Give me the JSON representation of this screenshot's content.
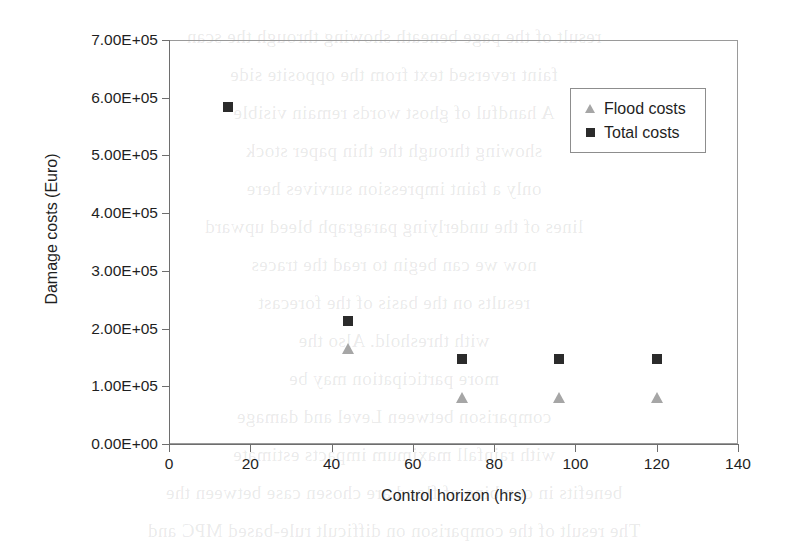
{
  "chart_data": {
    "type": "scatter",
    "title": "",
    "xlabel": "Control horizon (hrs)",
    "ylabel": "Damage costs (Euro)",
    "xlim": [
      0,
      140
    ],
    "ylim": [
      0,
      700000
    ],
    "xticks": [
      "0",
      "20",
      "40",
      "60",
      "80",
      "100",
      "120",
      "140"
    ],
    "xtick_values": [
      0,
      20,
      40,
      60,
      80,
      100,
      120,
      140
    ],
    "yticks": [
      "0.00E+00",
      "1.00E+05",
      "2.00E+05",
      "3.00E+05",
      "4.00E+05",
      "5.00E+05",
      "6.00E+05",
      "7.00E+05"
    ],
    "ytick_values": [
      0,
      100000,
      200000,
      300000,
      400000,
      500000,
      600000,
      700000
    ],
    "grid": false,
    "legend_position": "top-right",
    "x": [
      14.5,
      44,
      72,
      96,
      120
    ],
    "series": [
      {
        "name": "Flood costs",
        "marker": "triangle",
        "color": "#a6a6a6",
        "x": [
          44,
          72,
          96,
          120
        ],
        "values": [
          166000,
          81000,
          81000,
          81000
        ]
      },
      {
        "name": "Total costs",
        "marker": "square",
        "color": "#2b2b2b",
        "x": [
          14.5,
          44,
          72,
          96,
          120
        ],
        "values": [
          584000,
          213000,
          147000,
          147000,
          147000
        ]
      }
    ]
  },
  "legend": {
    "items": [
      {
        "label": "Flood costs",
        "marker": "triangle",
        "color": "#a6a6a6"
      },
      {
        "label": "Total costs",
        "marker": "square",
        "color": "#2b2b2b"
      }
    ]
  },
  "bleed_text": [
    "result of the page beneath showing through the scan",
    "faint reversed text from the opposite side",
    "A handful of ghost words remain visible",
    "showing through the thin paper stock",
    "only a faint impression survives here",
    "lines of the underlying paragraph bleed upward",
    "now we can begin to read the traces",
    "results on the basis of the forecast",
    "with threshold. Also the",
    "more participation may be",
    "comparison between Level and damage",
    "with rainfall maximum impacts estimate",
    "benefits in combine of flood are chosen case between the",
    "The result of the comparison on difficult rule-based MPC and"
  ]
}
